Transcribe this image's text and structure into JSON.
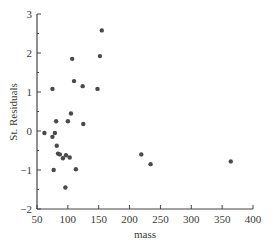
{
  "chart_data": {
    "type": "scatter",
    "title": "",
    "xlabel": "mass",
    "ylabel": "St. Residuals",
    "xlim": [
      50,
      400
    ],
    "ylim": [
      -2,
      3
    ],
    "xticks": [
      50,
      100,
      150,
      200,
      250,
      300,
      350,
      400
    ],
    "yticks": [
      -2,
      -1,
      0,
      1,
      2,
      3
    ],
    "grid": false,
    "legend": null,
    "point_color": "#4a4a4a",
    "points": [
      {
        "x": 62,
        "y": -0.05
      },
      {
        "x": 75,
        "y": 1.08
      },
      {
        "x": 75,
        "y": -0.15
      },
      {
        "x": 77,
        "y": -1.0
      },
      {
        "x": 79,
        "y": -0.05
      },
      {
        "x": 81,
        "y": 0.25
      },
      {
        "x": 82,
        "y": -0.38
      },
      {
        "x": 84,
        "y": -0.58
      },
      {
        "x": 87,
        "y": -0.6
      },
      {
        "x": 92,
        "y": -0.7
      },
      {
        "x": 96,
        "y": -1.45
      },
      {
        "x": 97,
        "y": -0.62
      },
      {
        "x": 100,
        "y": 0.25
      },
      {
        "x": 103,
        "y": -0.68
      },
      {
        "x": 105,
        "y": 0.45
      },
      {
        "x": 107,
        "y": 1.85
      },
      {
        "x": 110,
        "y": 1.28
      },
      {
        "x": 113,
        "y": -0.98
      },
      {
        "x": 124,
        "y": 1.15
      },
      {
        "x": 125,
        "y": 0.18
      },
      {
        "x": 148,
        "y": 1.08
      },
      {
        "x": 152,
        "y": 1.92
      },
      {
        "x": 155,
        "y": 2.58
      },
      {
        "x": 219,
        "y": -0.6
      },
      {
        "x": 234,
        "y": -0.85
      },
      {
        "x": 364,
        "y": -0.78
      }
    ]
  },
  "axes": {
    "x_title": "mass",
    "y_title": "St. Residuals"
  }
}
